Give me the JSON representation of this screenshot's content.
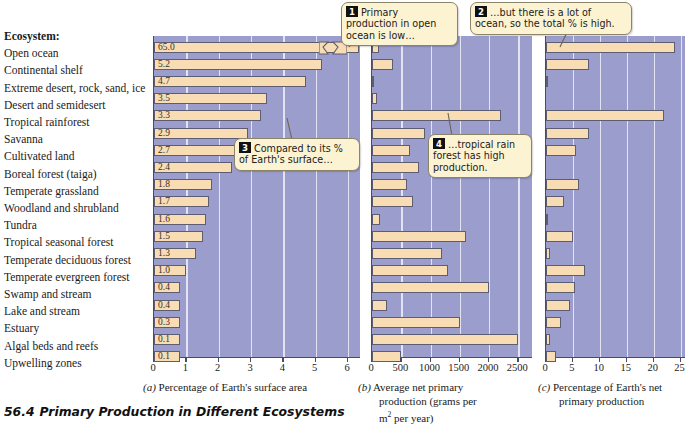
{
  "figure": {
    "number": "56.4",
    "title": "Primary Production in Different Ecosystems",
    "column_header": "Ecosystem:"
  },
  "ecosystems": [
    "Open ocean",
    "Continental shelf",
    "Extreme desert, rock, sand, ice",
    "Desert and semidesert",
    "Tropical rainforest",
    "Savanna",
    "Cultivated land",
    "Boreal forest (taiga)",
    "Temperate grassland",
    "Woodland and shrubland",
    "Tundra",
    "Tropical seasonal forest",
    "Temperate deciduous forest",
    "Temperate evergreen forest",
    "Swamp and stream",
    "Lake and stream",
    "Estuary",
    "Algal beds and reefs",
    "Upwelling zones"
  ],
  "callouts": [
    {
      "num": "1",
      "text": "Primary production in open ocean is low…"
    },
    {
      "num": "2",
      "text": "…but there is a lot of ocean, so the total % is high."
    },
    {
      "num": "3",
      "text": "Compared to its % of Earth's surface…"
    },
    {
      "num": "4",
      "text": "…tropical rain forest has high production."
    }
  ],
  "colors": {
    "plot_background": "#9b9dcd",
    "bar_fill": "#f8dcb4",
    "bar_stroke": "#5d5d72",
    "gridline": "#e9eaf6",
    "callout_fill": "#fbf3d2",
    "axis": "#4a4a66"
  },
  "chart_data": [
    {
      "type": "bar",
      "panel": "a",
      "orientation": "horizontal",
      "title": "Percentage of Earth's surface area",
      "caption_label": "(a)",
      "xlabel": "Percentage of Earth's surface area",
      "ylabel": "",
      "xlim": [
        0,
        6.4
      ],
      "ticks": [
        0,
        1,
        2,
        3,
        4,
        5,
        6
      ],
      "tick_labels": [
        "0",
        "1",
        "2",
        "3",
        "4",
        "5",
        "6"
      ],
      "grid": true,
      "axis_break": {
        "applies_to": "Open ocean",
        "note": "bar truncated with zigzag break"
      },
      "categories": [
        "Open ocean",
        "Continental shelf",
        "Extreme desert, rock, sand, ice",
        "Desert and semidesert",
        "Tropical rainforest",
        "Savanna",
        "Cultivated land",
        "Boreal forest (taiga)",
        "Temperate grassland",
        "Woodland and shrubland",
        "Tundra",
        "Tropical seasonal forest",
        "Temperate deciduous forest",
        "Temperate evergreen forest",
        "Swamp and stream",
        "Lake and stream",
        "Estuary",
        "Algal beds and reefs",
        "Upwelling zones"
      ],
      "values": [
        65.0,
        5.2,
        4.7,
        3.5,
        3.3,
        2.9,
        2.7,
        2.4,
        1.8,
        1.7,
        1.6,
        1.5,
        1.3,
        1.0,
        0.4,
        0.4,
        0.3,
        0.1,
        0.1
      ],
      "data_labels": [
        "65.0",
        "5.2",
        "4.7",
        "3.5",
        "3.3",
        "2.9",
        "2.7",
        "2.4",
        "1.8",
        "1.7",
        "1.6",
        "1.5",
        "1.3",
        "1.0",
        "0.4",
        "0.4",
        "0.3",
        "0.1",
        "0.1"
      ]
    },
    {
      "type": "bar",
      "panel": "b",
      "orientation": "horizontal",
      "title": "Average net primary production (grams per m2 per year)",
      "caption_label": "(b)",
      "xlabel": "Average net primary production (grams per m² per year)",
      "ylabel": "",
      "xlim": [
        0,
        2750
      ],
      "ticks": [
        0,
        500,
        1000,
        1500,
        2000,
        2500
      ],
      "tick_labels": [
        "0",
        "500",
        "1000",
        "1500",
        "2000",
        "2500"
      ],
      "grid": true,
      "categories": [
        "Open ocean",
        "Continental shelf",
        "Extreme desert, rock, sand, ice",
        "Desert and semidesert",
        "Tropical rainforest",
        "Savanna",
        "Cultivated land",
        "Boreal forest (taiga)",
        "Temperate grassland",
        "Woodland and shrubland",
        "Tundra",
        "Tropical seasonal forest",
        "Temperate deciduous forest",
        "Temperate evergreen forest",
        "Swamp and stream",
        "Lake and stream",
        "Estuary",
        "Algal beds and reefs",
        "Upwelling zones"
      ],
      "values": [
        125,
        360,
        3,
        90,
        2200,
        900,
        650,
        800,
        600,
        700,
        140,
        1600,
        1200,
        1300,
        2000,
        250,
        1500,
        2500,
        500
      ]
    },
    {
      "type": "bar",
      "panel": "c",
      "orientation": "horizontal",
      "title": "Percentage of Earth's net primary production",
      "caption_label": "(c)",
      "xlabel": "Percentage of Earth's net primary production",
      "ylabel": "",
      "xlim": [
        0,
        26
      ],
      "ticks": [
        0,
        5,
        10,
        15,
        20,
        25
      ],
      "tick_labels": [
        "0",
        "5",
        "10",
        "15",
        "20",
        "25"
      ],
      "grid": true,
      "categories": [
        "Open ocean",
        "Continental shelf",
        "Extreme desert, rock, sand, ice",
        "Desert and semidesert",
        "Tropical rainforest",
        "Savanna",
        "Cultivated land",
        "Boreal forest (taiga)",
        "Temperate grassland",
        "Woodland and shrubland",
        "Tundra",
        "Tropical seasonal forest",
        "Temperate deciduous forest",
        "Temperate evergreen forest",
        "Swamp and stream",
        "Lake and stream",
        "Estuary",
        "Algal beds and reefs",
        "Upwelling zones"
      ],
      "values": [
        24.0,
        8.0,
        0.3,
        0.0,
        22.0,
        8.0,
        5.5,
        0.0,
        6.2,
        3.3,
        0.4,
        5.0,
        0.8,
        7.2,
        5.3,
        4.5,
        2.8,
        0.8,
        1.8,
        1.4
      ]
    }
  ],
  "captions": {
    "a_label": "(a)",
    "a_text": "Percentage of Earth's surface area",
    "b_label": "(b)",
    "b_line1": "Average net primary",
    "b_line2": "production (grams per",
    "b_line3": "m",
    "b_line3_sup": "2",
    "b_line3_rest": " per year)",
    "c_label": "(c)",
    "c_line1": "Percentage of Earth's net",
    "c_line2": "primary production"
  }
}
